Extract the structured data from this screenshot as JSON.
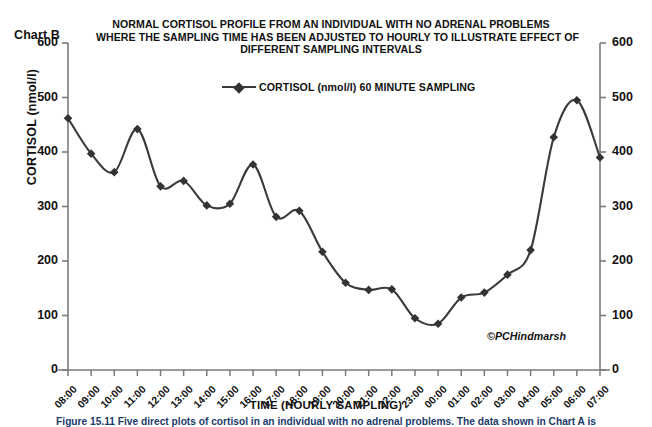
{
  "chart_label": "Chart B",
  "title_lines": [
    "NORMAL CORTISOL PROFILE FROM AN INDIVIDUAL WITH NO ADRENAL PROBLEMS",
    "WHERE THE SAMPLING TIME HAS BEEN ADJUSTED TO HOURLY TO ILLUSTRATE EFFECT OF",
    "DIFFERENT SAMPLING INTERVALS"
  ],
  "credit": "©PCHindmarsh",
  "caption": "Figure 15.11  Five direct plots of cortisol in an individual with no adrenal problems. The data shown in Chart A is",
  "legend_label": "CORTISOL (nmol/l) 60 MINUTE SAMPLING",
  "colors": {
    "line": "#3a3a3a",
    "marker": "#333333",
    "axis": "#7a7a7a",
    "text": "#111111",
    "caption": "#1b3a6b"
  },
  "chart_data": {
    "type": "line",
    "title": "NORMAL CORTISOL PROFILE FROM AN INDIVIDUAL WITH NO ADRENAL PROBLEMS WHERE THE SAMPLING TIME HAS BEEN ADJUSTED TO HOURLY TO ILLUSTRATE EFFECT OF DIFFERENT SAMPLING INTERVALS",
    "xlabel": "TIME (HOURLY SAMPLING)",
    "ylabel": "CORTISOL (nmol/l)",
    "ylim": [
      0,
      600
    ],
    "yticks": [
      0,
      100,
      200,
      300,
      400,
      500,
      600
    ],
    "y_axis_right": true,
    "yticks_right": [
      0,
      100,
      200,
      300,
      400,
      500,
      600
    ],
    "grid": false,
    "legend_position": "top-center-inside",
    "smoothing": "spline",
    "marker": "diamond",
    "categories": [
      "08:00",
      "09:00",
      "10:00",
      "11:00",
      "12:00",
      "13:00",
      "14:00",
      "15:00",
      "16:00",
      "17:00",
      "18:00",
      "19:00",
      "20:00",
      "21:00",
      "22:00",
      "23:00",
      "00:00",
      "01:00",
      "02:00",
      "03:00",
      "04:00",
      "05:00",
      "06:00",
      "07:00"
    ],
    "series": [
      {
        "name": "CORTISOL (nmol/l) 60 MINUTE SAMPLING",
        "values": [
          462,
          397,
          363,
          442,
          337,
          347,
          302,
          305,
          377,
          281,
          292,
          217,
          160,
          147,
          148,
          95,
          85,
          133,
          142,
          175,
          220,
          427,
          495,
          390
        ]
      }
    ]
  }
}
